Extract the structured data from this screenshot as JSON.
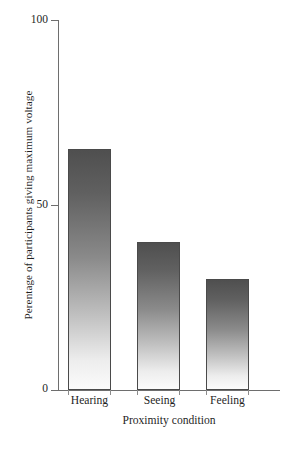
{
  "chart_data": {
    "type": "bar",
    "title": "",
    "categories": [
      "Hearing",
      "Seeing",
      "Feeling"
    ],
    "values": [
      65,
      40,
      30
    ],
    "series": [
      {
        "name": "Percentage giving maximum voltage",
        "values": [
          65,
          40,
          30
        ]
      }
    ],
    "xlabel": "Proximity condition",
    "ylabel": "Perentage of participants giving maximum voltage",
    "ylim": [
      0,
      100
    ],
    "ytick_labels": [
      "0",
      "50",
      "100"
    ],
    "ytick_values": [
      0,
      50,
      100
    ],
    "grid": false,
    "legend": false,
    "legend_position": "none",
    "bar_style": {
      "fill": "vertical-gradient-dark-to-light",
      "gradient_top_color": "#4f4f4f",
      "gradient_bottom_color": "#fbfbfb",
      "outline_color": "#4a4a4a"
    },
    "axis_color": "#6e6e6e",
    "background_color": "#ffffff"
  }
}
